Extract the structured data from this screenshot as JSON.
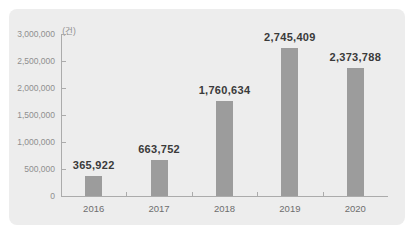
{
  "chart_data": {
    "type": "bar",
    "title": "",
    "xlabel": "",
    "ylabel": "",
    "unit_label": "(건)",
    "categories": [
      "2016",
      "2017",
      "2018",
      "2019",
      "2020"
    ],
    "values": [
      365922,
      663752,
      1760634,
      2745409,
      2373788
    ],
    "value_labels": [
      "365,922",
      "663,752",
      "1,760,634",
      "2,745,409",
      "2,373,788"
    ],
    "ylim": [
      0,
      3000000
    ],
    "ytick_interval": 500000,
    "ytick_labels": [
      "0",
      "500,000",
      "1,000,000",
      "1,500,000",
      "2,000,000",
      "2,500,000",
      "3,000,000"
    ],
    "grid": false,
    "legend": "none",
    "colors": {
      "bar": "#9c9c9c",
      "card_background": "#ededed",
      "page_background": "#ffffff",
      "axis": "#ababab",
      "tick_text": "#8f8f8f",
      "category_text": "#6e6e6e",
      "value_text": "#3a3a3a"
    }
  }
}
